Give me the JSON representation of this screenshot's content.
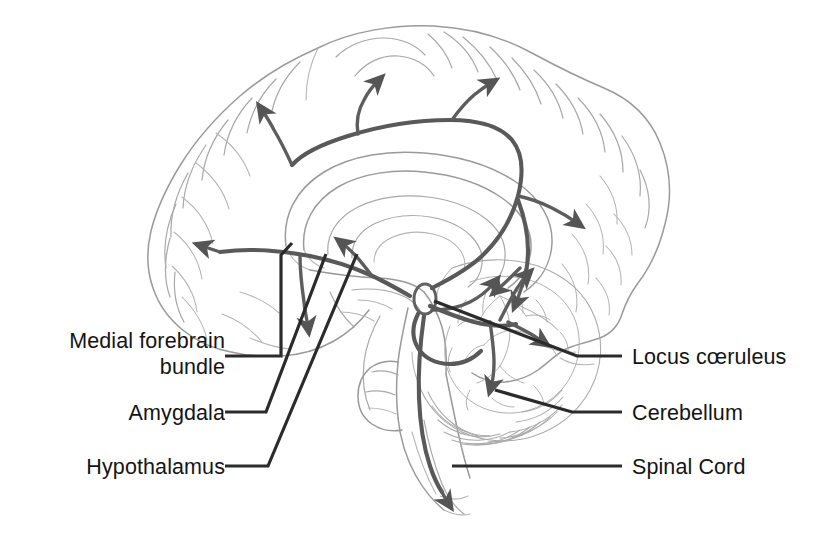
{
  "figure": {
    "view": "mid-sagittal section of the human brain",
    "background_color": "#ffffff",
    "outline_color": "#9a9a9a",
    "pathway_color": "#595959",
    "leader_color": "#2b2b2b",
    "label_color": "#141414"
  },
  "labels": {
    "left": [
      {
        "id": "medial-forebrain-bundle",
        "line1": "Medial forebrain",
        "line2": "bundle",
        "text": "Medial forebrain bundle"
      },
      {
        "id": "amygdala",
        "line1": "Amygdala",
        "line2": "",
        "text": "Amygdala"
      },
      {
        "id": "hypothalamus",
        "line1": "Hypothalamus",
        "line2": "",
        "text": "Hypothalamus"
      }
    ],
    "right": [
      {
        "id": "locus-coeruleus",
        "line1": "Locus cœruleus",
        "text": "Locus cœruleus"
      },
      {
        "id": "cerebellum",
        "line1": "Cerebellum",
        "text": "Cerebellum"
      },
      {
        "id": "spinal-cord",
        "line1": "Spinal Cord",
        "text": "Spinal Cord"
      }
    ]
  },
  "structures": [
    {
      "id": "cerebral-cortex",
      "name": "Cerebral cortex"
    },
    {
      "id": "corpus-callosum",
      "name": "Corpus callosum"
    },
    {
      "id": "brainstem",
      "name": "Brainstem"
    },
    {
      "id": "cerebellum-body",
      "name": "Cerebellum"
    },
    {
      "id": "locus-coeruleus-nucleus",
      "name": "Locus coeruleus"
    },
    {
      "id": "spinal-cord-body",
      "name": "Spinal cord"
    }
  ],
  "pathways": [
    {
      "id": "ascending-dorsal-bundle",
      "name": "Ascending dorsal noradrenergic bundle to cortex",
      "arrow_count": 4
    },
    {
      "id": "frontal-projection",
      "name": "Projection to frontal cortex",
      "arrow_count": 1
    },
    {
      "id": "occipital-projection",
      "name": "Projection to occipital cortex",
      "arrow_count": 1
    },
    {
      "id": "medial-forebrain-bundle-path",
      "name": "Medial forebrain bundle projection",
      "arrow_count": 1
    },
    {
      "id": "cerebellar-projection",
      "name": "Projection to cerebellum",
      "arrow_count": 3
    },
    {
      "id": "descending-spinal-projection",
      "name": "Descending projection to spinal cord",
      "arrow_count": 1
    }
  ]
}
